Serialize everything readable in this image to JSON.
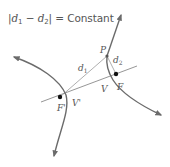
{
  "equation": {
    "abs_open": "|",
    "d1_var": "d",
    "d1_sub": "1",
    "minus": " − ",
    "d2_var": "d",
    "d2_sub": "2",
    "abs_close": "|",
    "equals": " = ",
    "rhs": "Constant"
  },
  "labels": {
    "P": "P",
    "d1": "d",
    "d1_sub": "1",
    "d2": "d",
    "d2_sub": "2",
    "F": "F",
    "F_prime": "F'",
    "V": "V",
    "V_prime": "V'"
  },
  "colors": {
    "curve": "#6b6b6b",
    "line": "#8a8a8a",
    "text": "#555555",
    "point": "#111111"
  }
}
